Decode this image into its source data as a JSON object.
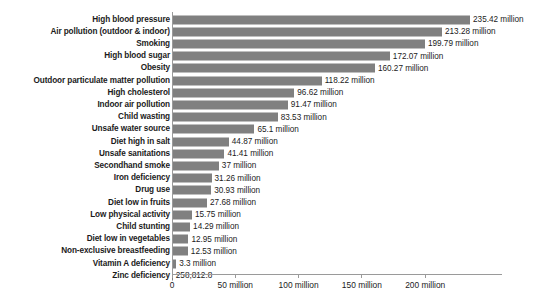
{
  "chart_data": {
    "type": "bar",
    "orientation": "horizontal",
    "title": "",
    "subtitle": "",
    "xlabel": "",
    "ylabel": "",
    "xlim": [
      0,
      235.42
    ],
    "grid": false,
    "legend": null,
    "bar_color": "#808080",
    "background_color": "#ffffff",
    "axis_color": "#9a9a9a",
    "text_color": "#1b1b1b",
    "unit": "million",
    "axis": {
      "tick_values": [
        0,
        50,
        100,
        150,
        200
      ],
      "tick_labels": [
        "0",
        "50 million",
        "100 million",
        "150 million",
        "200 million"
      ]
    },
    "categories": [
      "High blood pressure",
      "Air pollution (outdoor & indoor)",
      "Smoking",
      "High blood sugar",
      "Obesity",
      "Outdoor particulate matter pollution",
      "High cholesterol",
      "Indoor air pollution",
      "Child wasting",
      "Unsafe water source",
      "Diet high in salt",
      "Unsafe sanitations",
      "Secondhand smoke",
      "Iron deficiency",
      "Drug use",
      "Diet low in fruits",
      "Low physical activity",
      "Child stunting",
      "Diet low in vegetables",
      "Non-exclusive breastfeeding",
      "Vitamin A deficiency",
      "Zinc deficiency"
    ],
    "values": [
      235.42,
      213.28,
      199.79,
      172.07,
      160.27,
      118.22,
      96.62,
      91.47,
      83.53,
      65.1,
      44.87,
      41.41,
      37,
      31.26,
      30.93,
      27.68,
      15.75,
      14.29,
      12.95,
      12.53,
      3.3,
      0.2588128
    ],
    "value_labels": [
      "235.42 million",
      "213.28 million",
      "199.79 million",
      "172.07 million",
      "160.27 million",
      "118.22 million",
      "96.62 million",
      "91.47 million",
      "83.53 million",
      "65.1 million",
      "44.87 million",
      "41.41 million",
      "37 million",
      "31.26 million",
      "30.93 million",
      "27.68 million",
      "15.75 million",
      "14.29 million",
      "12.95 million",
      "12.53 million",
      "3.3 million",
      "258,812.8"
    ]
  }
}
